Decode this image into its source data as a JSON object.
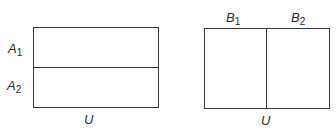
{
  "left_diagram": {
    "universe_label": "U",
    "partition": [
      {
        "letter": "A",
        "index": "1"
      },
      {
        "letter": "A",
        "index": "2"
      }
    ],
    "orientation": "horizontal"
  },
  "right_diagram": {
    "universe_label": "U",
    "partition": [
      {
        "letter": "B",
        "index": "1"
      },
      {
        "letter": "B",
        "index": "2"
      }
    ],
    "orientation": "vertical"
  },
  "colors": {
    "line": "#3a3a3a",
    "text": "#2a2a2a",
    "background": "#ffffff"
  }
}
